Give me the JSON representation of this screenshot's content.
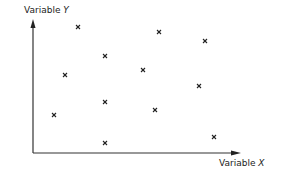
{
  "chart_data": {
    "type": "scatter",
    "title": "",
    "xlabel": "Variable X",
    "ylabel": "Variable Y",
    "marker": "x",
    "grid": false,
    "legend": null,
    "axis_ticks": "none",
    "points_px": [
      {
        "x": 78,
        "y": 27
      },
      {
        "x": 159,
        "y": 32
      },
      {
        "x": 205,
        "y": 41
      },
      {
        "x": 105,
        "y": 56
      },
      {
        "x": 143,
        "y": 70
      },
      {
        "x": 65,
        "y": 75
      },
      {
        "x": 199,
        "y": 86
      },
      {
        "x": 105,
        "y": 102
      },
      {
        "x": 155,
        "y": 110
      },
      {
        "x": 54,
        "y": 115
      },
      {
        "x": 214,
        "y": 137
      },
      {
        "x": 105,
        "y": 143
      }
    ],
    "points": [
      {
        "x": 0.22,
        "y": 0.97
      },
      {
        "x": 0.61,
        "y": 0.93
      },
      {
        "x": 0.83,
        "y": 0.86
      },
      {
        "x": 0.35,
        "y": 0.74
      },
      {
        "x": 0.53,
        "y": 0.63
      },
      {
        "x": 0.16,
        "y": 0.6
      },
      {
        "x": 0.8,
        "y": 0.51
      },
      {
        "x": 0.35,
        "y": 0.39
      },
      {
        "x": 0.58,
        "y": 0.33
      },
      {
        "x": 0.1,
        "y": 0.29
      },
      {
        "x": 0.87,
        "y": 0.12
      },
      {
        "x": 0.35,
        "y": 0.08
      }
    ]
  },
  "labels": {
    "y_prefix": "Variable ",
    "y_var": "Y",
    "x_prefix": "Variable ",
    "x_var": "X"
  }
}
